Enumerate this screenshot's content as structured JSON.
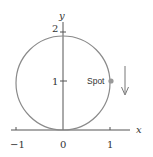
{
  "diagram": {
    "type": "coordinate-diagram",
    "axes": {
      "x_label": "x",
      "y_label": "y",
      "x_ticks": [
        {
          "value": -1,
          "label": "−1"
        },
        {
          "value": 0,
          "label": "0"
        },
        {
          "value": 1,
          "label": "1"
        }
      ],
      "y_ticks": [
        {
          "value": 1,
          "label": "1"
        },
        {
          "value": 2,
          "label": "2"
        }
      ]
    },
    "circle": {
      "center": [
        0,
        1
      ],
      "radius": 1,
      "color": "#8a8a8a"
    },
    "point": {
      "label": "Spot",
      "position": [
        1,
        1
      ],
      "color": "#999999"
    },
    "arrow": {
      "direction": "down",
      "color": "#777777"
    }
  }
}
